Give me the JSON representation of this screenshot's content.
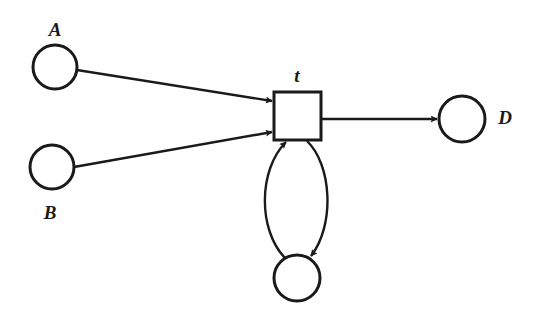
{
  "diagram": {
    "type": "petri-net",
    "places": [
      {
        "id": "A",
        "label": "A",
        "cx": 55,
        "cy": 67,
        "r": 22,
        "label_x": 55,
        "label_y": 36
      },
      {
        "id": "B",
        "label": "B",
        "cx": 52,
        "cy": 167,
        "r": 22,
        "label_x": 50,
        "label_y": 219
      },
      {
        "id": "D",
        "label": "D",
        "cx": 462,
        "cy": 119,
        "r": 23,
        "label_x": 505,
        "label_y": 124
      },
      {
        "id": "P",
        "label": "",
        "cx": 297,
        "cy": 278,
        "r": 23
      }
    ],
    "transitions": [
      {
        "id": "t",
        "label": "t",
        "x": 274,
        "y": 92,
        "w": 47,
        "h": 48,
        "label_x": 297,
        "label_y": 82
      }
    ],
    "arcs": [
      {
        "from": "A",
        "to": "t"
      },
      {
        "from": "B",
        "to": "t"
      },
      {
        "from": "t",
        "to": "D"
      },
      {
        "from": "t",
        "to": "P"
      },
      {
        "from": "P",
        "to": "t"
      }
    ],
    "colors": {
      "stroke": "#1a1a1a",
      "background": "#ffffff"
    }
  }
}
